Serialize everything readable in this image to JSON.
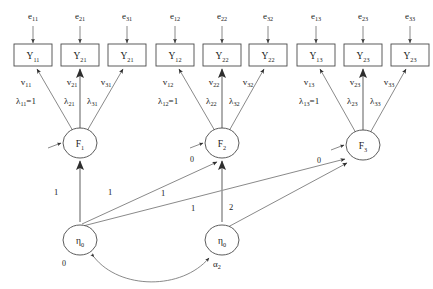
{
  "diagram": {
    "type": "sem-path-diagram",
    "colors": {
      "background": "#ffffff",
      "stroke": "#6b6b6b",
      "node_stroke": "#4a4a4a",
      "thick_stroke": "#9a9a9a",
      "text": "#1a1a1a"
    },
    "residuals": [
      {
        "base": "e",
        "sub": "11"
      },
      {
        "base": "e",
        "sub": "21"
      },
      {
        "base": "e",
        "sub": "31"
      },
      {
        "base": "e",
        "sub": "12"
      },
      {
        "base": "e",
        "sub": "22"
      },
      {
        "base": "e",
        "sub": "32"
      },
      {
        "base": "e",
        "sub": "13"
      },
      {
        "base": "e",
        "sub": "23"
      },
      {
        "base": "e",
        "sub": "33"
      }
    ],
    "indicators": [
      {
        "base": "Y",
        "sub": "11"
      },
      {
        "base": "Y",
        "sub": "21"
      },
      {
        "base": "Y",
        "sub": "21"
      },
      {
        "base": "Y",
        "sub": "12"
      },
      {
        "base": "Y",
        "sub": "22"
      },
      {
        "base": "Y",
        "sub": "22"
      },
      {
        "base": "Y",
        "sub": "13"
      },
      {
        "base": "Y",
        "sub": "23"
      },
      {
        "base": "Y",
        "sub": "23"
      }
    ],
    "intercepts": [
      {
        "base": "v",
        "sub": "11"
      },
      {
        "base": "v",
        "sub": "21"
      },
      {
        "base": "v",
        "sub": "31"
      },
      {
        "base": "v",
        "sub": "12"
      },
      {
        "base": "v",
        "sub": "22"
      },
      {
        "base": "v",
        "sub": "32"
      },
      {
        "base": "v",
        "sub": "13"
      },
      {
        "base": "v",
        "sub": "23"
      },
      {
        "base": "v",
        "sub": "33"
      }
    ],
    "loadings": [
      {
        "base": "λ",
        "sub": "11",
        "suffix": "=1"
      },
      {
        "base": "λ",
        "sub": "21",
        "suffix": ""
      },
      {
        "base": "λ",
        "sub": "31",
        "suffix": ""
      },
      {
        "base": "λ",
        "sub": "12",
        "suffix": "=1"
      },
      {
        "base": "λ",
        "sub": "22",
        "suffix": ""
      },
      {
        "base": "λ",
        "sub": "32",
        "suffix": ""
      },
      {
        "base": "λ",
        "sub": "13",
        "suffix": "=1"
      },
      {
        "base": "λ",
        "sub": "23",
        "suffix": ""
      },
      {
        "base": "λ",
        "sub": "33",
        "suffix": ""
      }
    ],
    "factors": [
      {
        "base": "F",
        "sub": "1",
        "mean_label": ""
      },
      {
        "base": "F",
        "sub": "2",
        "mean_label": "0"
      },
      {
        "base": "F",
        "sub": "3",
        "mean_label": "0"
      }
    ],
    "growth_factors": [
      {
        "base": "η",
        "sub": "0",
        "mean_label": "0"
      },
      {
        "base": "η",
        "sub": "0",
        "mean_label": "α",
        "mean_sub": "2"
      }
    ],
    "structural_coefficients": [
      {
        "value": "1",
        "from": "eta0",
        "to": "F1"
      },
      {
        "value": "1",
        "from": "eta0",
        "to": "F2"
      },
      {
        "value": "1",
        "from": "eta0",
        "to": "F3"
      },
      {
        "value": "1",
        "from": "eta1",
        "to": "F2"
      },
      {
        "value": "2",
        "from": "eta1",
        "to": "F3"
      }
    ]
  }
}
